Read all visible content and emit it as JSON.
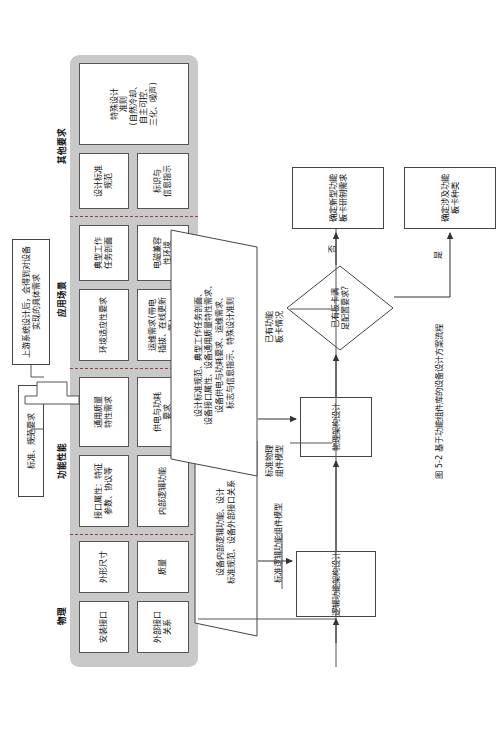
{
  "figure": {
    "caption": "图 5-2 基于功能组件库的设备设计方案流程"
  },
  "inputs": {
    "standards_box": "标准、规范要求",
    "upstream_box": "上游系统设计后，会得到对设备实现的具体需求"
  },
  "requirements_band": {
    "sections": [
      {
        "name": "物理",
        "label": "物理",
        "cells": [
          "安装接口",
          "外形尺寸",
          "外部接口\n关系",
          "质量"
        ]
      },
      {
        "name": "功能性能",
        "label": "功能性能",
        "cells": [
          "接口属性：特征\n参数、协议等",
          "通用质量\n特性需求",
          "内部逻辑功能",
          "供电与功耗\n要求"
        ]
      },
      {
        "name": "应用场景",
        "label": "应用场景",
        "cells": [
          "环境适应性要求",
          "典型工作\n任务剖面",
          "运维需求(带电\n插拔、在线更新等)",
          "电磁兼容\n性环境"
        ]
      },
      {
        "name": "其他要求",
        "label": "其他要求",
        "cells": [
          "设计标准\n规范",
          "特殊设计\n准则\n(自然冷却、\n自主可控、\n三化、噪声)",
          "标识与\n信息指示"
        ]
      }
    ]
  },
  "flow": {
    "nodes": [
      {
        "id": "logic-design",
        "label": "逻辑功能架构设计"
      },
      {
        "id": "physical-design",
        "label": "物理架构设计"
      },
      {
        "id": "decision",
        "label": "已有板卡满\n足配置要求?"
      },
      {
        "id": "new-board",
        "label": "确定新型功能\n板卡研制需求"
      },
      {
        "id": "board-types",
        "label": "确定涉及功能\n板卡种类"
      }
    ],
    "parallelograms": [
      {
        "id": "logic-inputs",
        "label": "设备内部逻辑功能、设计\n标准规范、设备外部接口关系"
      },
      {
        "id": "physical-inputs",
        "label": "设计标准规范、典型工作任务剖面、\n设备接口属性、设备通用质量特性需求、\n设备供电与功耗要求、运维需求、\n标志与信息指示、特殊设计准则"
      }
    ],
    "side_labels": [
      {
        "id": "std-logic-model",
        "label": "标准逻辑功能组件模型"
      },
      {
        "id": "std-physical-model",
        "label": "标准物理\n组件模型"
      },
      {
        "id": "existing-board",
        "label": "已有功能\n板卡情况"
      }
    ],
    "branch_labels": [
      {
        "id": "branch-no",
        "label": "否"
      },
      {
        "id": "branch-yes",
        "label": "是"
      }
    ]
  },
  "colors": {
    "band": "#c9c9c9",
    "divider": "#9a3b3b",
    "box_border": "#444444",
    "text": "#111111"
  }
}
